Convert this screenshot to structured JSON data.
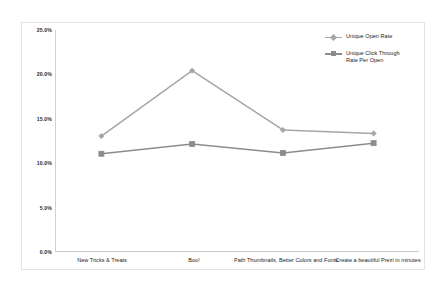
{
  "chart_data": {
    "type": "line",
    "title": "",
    "subtitle": "",
    "xlabel": "",
    "ylabel": "",
    "ylim": [
      0,
      25
    ],
    "ytick_values": [
      0,
      5,
      10,
      15,
      20,
      25
    ],
    "ytick_labels": [
      "0.0%",
      "5.0%",
      "10.0%",
      "15.0%",
      "20.0%",
      "25.0%"
    ],
    "grid": false,
    "legend_position": "top-right",
    "categories": [
      "New Tricks & Treats",
      "Boo!",
      "Path Thumbnails, Better\nColors and Fonts",
      "Create a beautiful\nPrezi in minutes"
    ],
    "series": [
      {
        "name": "Unique Open Rate",
        "values": [
          13.0,
          20.4,
          13.7,
          13.3
        ],
        "color": "#a6a6a6",
        "marker": "diamond"
      },
      {
        "name": "Unique Click Through\nRate Per Open",
        "values": [
          11.0,
          12.1,
          11.1,
          12.2
        ],
        "color": "#8c8c8c",
        "marker": "square"
      }
    ]
  },
  "legend": {
    "items": [
      {
        "label": "Unique Open Rate"
      },
      {
        "label": "Unique Click Through\nRate Per Open"
      }
    ]
  },
  "colors": {
    "series_open_rate": "#a6a6a6",
    "series_click_through": "#8c8c8c",
    "axis": "#c9c9c9",
    "frame": "#e3e3e3",
    "text": "#1d1d1d",
    "background": "#ffffff"
  }
}
